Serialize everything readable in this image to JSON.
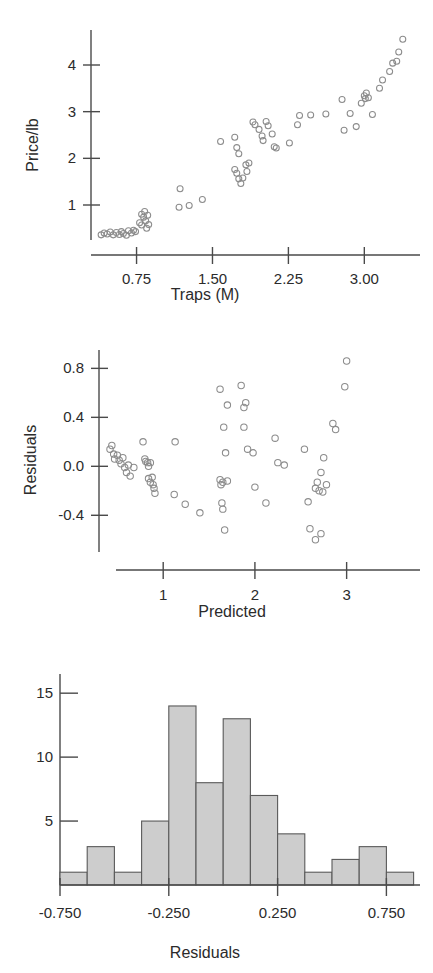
{
  "figure": {
    "title": "",
    "background": "#ffffff",
    "point_stroke": "#8c8c8c",
    "axis_color": "#4a4a4a",
    "bar_fill": "#cdcdcd",
    "bar_stroke": "#5a5a5a"
  },
  "chart_data": [
    {
      "type": "scatter",
      "id": "price-vs-traps",
      "title": "",
      "xlabel": "Traps (M)",
      "ylabel": "Price/lb",
      "xticks": [
        0.75,
        1.5,
        2.25,
        3.0
      ],
      "xtick_labels": [
        "0.75",
        "1.50",
        "2.25",
        "3.00"
      ],
      "yticks": [
        1,
        2,
        3,
        4
      ],
      "ytick_labels": [
        "1",
        "2",
        "3",
        "4"
      ],
      "xlim": [
        0.3,
        3.55
      ],
      "ylim": [
        0.25,
        4.75
      ],
      "grid": false,
      "legend": null,
      "marker": "open-circle",
      "points": [
        [
          0.4,
          0.36
        ],
        [
          0.43,
          0.4
        ],
        [
          0.46,
          0.38
        ],
        [
          0.49,
          0.42
        ],
        [
          0.52,
          0.36
        ],
        [
          0.55,
          0.41
        ],
        [
          0.58,
          0.37
        ],
        [
          0.6,
          0.43
        ],
        [
          0.62,
          0.39
        ],
        [
          0.65,
          0.35
        ],
        [
          0.67,
          0.45
        ],
        [
          0.7,
          0.4
        ],
        [
          0.72,
          0.46
        ],
        [
          0.74,
          0.43
        ],
        [
          0.78,
          0.62
        ],
        [
          0.8,
          0.57
        ],
        [
          0.8,
          0.8
        ],
        [
          0.82,
          0.74
        ],
        [
          0.83,
          0.86
        ],
        [
          0.84,
          0.66
        ],
        [
          0.85,
          0.5
        ],
        [
          0.86,
          0.78
        ],
        [
          0.87,
          0.58
        ],
        [
          1.18,
          1.35
        ],
        [
          1.17,
          0.95
        ],
        [
          1.27,
          0.99
        ],
        [
          1.4,
          1.12
        ],
        [
          1.58,
          2.36
        ],
        [
          1.72,
          2.45
        ],
        [
          1.74,
          2.23
        ],
        [
          1.76,
          2.1
        ],
        [
          1.72,
          1.76
        ],
        [
          1.74,
          1.68
        ],
        [
          1.76,
          1.56
        ],
        [
          1.78,
          1.46
        ],
        [
          1.8,
          1.58
        ],
        [
          1.83,
          1.86
        ],
        [
          1.86,
          1.9
        ],
        [
          1.84,
          1.72
        ],
        [
          1.9,
          2.78
        ],
        [
          1.92,
          2.72
        ],
        [
          1.96,
          2.62
        ],
        [
          1.99,
          2.48
        ],
        [
          2.0,
          2.38
        ],
        [
          2.03,
          2.79
        ],
        [
          2.05,
          2.7
        ],
        [
          2.09,
          2.52
        ],
        [
          2.11,
          2.25
        ],
        [
          2.13,
          2.22
        ],
        [
          2.26,
          2.33
        ],
        [
          2.34,
          2.72
        ],
        [
          2.36,
          2.92
        ],
        [
          2.47,
          2.93
        ],
        [
          2.62,
          2.95
        ],
        [
          2.78,
          3.26
        ],
        [
          2.8,
          2.6
        ],
        [
          2.86,
          2.96
        ],
        [
          2.92,
          2.68
        ],
        [
          2.97,
          3.18
        ],
        [
          3.0,
          3.34
        ],
        [
          3.01,
          3.28
        ],
        [
          3.02,
          3.4
        ],
        [
          3.04,
          3.3
        ],
        [
          3.08,
          2.94
        ],
        [
          3.15,
          3.5
        ],
        [
          3.18,
          3.68
        ],
        [
          3.25,
          3.86
        ],
        [
          3.28,
          4.04
        ],
        [
          3.32,
          4.08
        ],
        [
          3.34,
          4.28
        ],
        [
          3.38,
          4.55
        ]
      ]
    },
    {
      "type": "scatter",
      "id": "residuals-vs-predicted",
      "title": "",
      "xlabel": "Predicted",
      "ylabel": "Residuals",
      "xticks": [
        1,
        2,
        3
      ],
      "xtick_labels": [
        "1",
        "2",
        "3"
      ],
      "yticks": [
        0.8,
        0.4,
        0.0,
        -0.4
      ],
      "ytick_labels": [
        "0.8",
        "0.4",
        "0.0",
        "-0.4"
      ],
      "xlim": [
        0.3,
        3.8
      ],
      "ylim": [
        -0.7,
        0.95
      ],
      "grid": false,
      "legend": null,
      "marker": "open-circle",
      "points": [
        [
          0.42,
          0.14
        ],
        [
          0.44,
          0.17
        ],
        [
          0.46,
          0.1
        ],
        [
          0.47,
          0.06
        ],
        [
          0.5,
          0.09
        ],
        [
          0.52,
          0.05
        ],
        [
          0.54,
          0.02
        ],
        [
          0.56,
          0.07
        ],
        [
          0.58,
          -0.01
        ],
        [
          0.6,
          -0.05
        ],
        [
          0.62,
          0.01
        ],
        [
          0.64,
          -0.08
        ],
        [
          0.68,
          -0.01
        ],
        [
          0.78,
          0.2
        ],
        [
          0.8,
          0.06
        ],
        [
          0.81,
          0.04
        ],
        [
          0.83,
          0.03
        ],
        [
          0.84,
          0.0
        ],
        [
          0.86,
          0.03
        ],
        [
          0.84,
          -0.1
        ],
        [
          0.86,
          -0.13
        ],
        [
          0.88,
          -0.09
        ],
        [
          0.89,
          -0.15
        ],
        [
          0.9,
          -0.18
        ],
        [
          0.91,
          -0.22
        ],
        [
          1.13,
          0.2
        ],
        [
          1.12,
          -0.23
        ],
        [
          1.24,
          -0.31
        ],
        [
          1.4,
          -0.38
        ],
        [
          1.62,
          0.63
        ],
        [
          1.7,
          0.5
        ],
        [
          1.66,
          0.32
        ],
        [
          1.68,
          0.11
        ],
        [
          1.62,
          -0.11
        ],
        [
          1.63,
          -0.15
        ],
        [
          1.65,
          -0.13
        ],
        [
          1.7,
          -0.12
        ],
        [
          1.64,
          -0.3
        ],
        [
          1.65,
          -0.35
        ],
        [
          1.67,
          -0.52
        ],
        [
          1.85,
          0.66
        ],
        [
          1.88,
          0.48
        ],
        [
          1.9,
          0.52
        ],
        [
          1.88,
          0.32
        ],
        [
          1.92,
          0.14
        ],
        [
          1.98,
          0.11
        ],
        [
          2.0,
          -0.17
        ],
        [
          2.22,
          0.23
        ],
        [
          2.25,
          0.03
        ],
        [
          2.32,
          0.01
        ],
        [
          2.12,
          -0.3
        ],
        [
          2.54,
          0.14
        ],
        [
          2.58,
          -0.29
        ],
        [
          2.75,
          0.07
        ],
        [
          2.72,
          -0.05
        ],
        [
          2.68,
          -0.13
        ],
        [
          2.66,
          -0.18
        ],
        [
          2.7,
          -0.2
        ],
        [
          2.74,
          -0.21
        ],
        [
          2.78,
          -0.15
        ],
        [
          2.85,
          0.35
        ],
        [
          2.88,
          0.3
        ],
        [
          2.98,
          0.65
        ],
        [
          3.0,
          0.86
        ],
        [
          2.6,
          -0.51
        ],
        [
          2.72,
          -0.55
        ],
        [
          2.66,
          -0.6
        ]
      ]
    },
    {
      "type": "bar",
      "id": "residuals-histogram",
      "title": "",
      "xlabel": "Residuals",
      "ylabel": "",
      "bin_width": 0.125,
      "bin_starts": [
        -0.75,
        -0.625,
        -0.5,
        -0.375,
        -0.25,
        -0.125,
        0.0,
        0.125,
        0.25,
        0.375,
        0.5,
        0.625,
        0.75
      ],
      "categories": [
        "-0.750",
        "-0.625",
        "-0.500",
        "-0.375",
        "-0.250",
        "-0.125",
        "0.000",
        "0.125",
        "0.250",
        "0.375",
        "0.500",
        "0.625",
        "0.750"
      ],
      "values": [
        1,
        3,
        1,
        5,
        14,
        8,
        13,
        7,
        4,
        1,
        2,
        3,
        1
      ],
      "xticks": [
        -0.75,
        -0.25,
        0.25,
        0.75
      ],
      "xtick_labels": [
        "-0.750",
        "-0.250",
        "0.250",
        "0.750"
      ],
      "yticks": [
        5,
        10,
        15
      ],
      "ytick_labels": [
        "5",
        "10",
        "15"
      ],
      "xlim": [
        -0.75,
        0.875
      ],
      "ylim": [
        0,
        16.5
      ],
      "grid": false,
      "legend": null
    }
  ]
}
